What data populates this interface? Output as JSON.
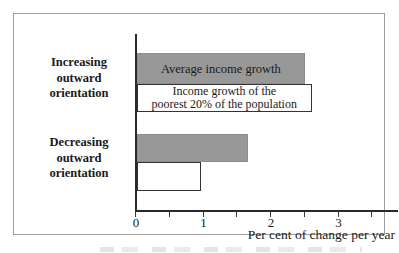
{
  "chart_data": {
    "type": "bar",
    "orientation": "horizontal",
    "title": "",
    "xlabel": "Per cent of change per year",
    "ylabel": "",
    "xlim": [
      0,
      3.85
    ],
    "xticks": [
      "0",
      "1",
      "2",
      "3"
    ],
    "minor_xticks": [
      0.5,
      1.5,
      2.5,
      3.5
    ],
    "grid": false,
    "legend_position": "labels-inside-first-group-bars",
    "categories": [
      "Increasing outward orientation",
      "Decreasing outward orientation"
    ],
    "series": [
      {
        "name": "Average income growth",
        "color": "#989898",
        "values": [
          2.5,
          1.65
        ]
      },
      {
        "name": "Income growth of the poorest 20% of the population",
        "color": "#ffffff",
        "values": [
          2.6,
          0.95
        ]
      }
    ]
  },
  "labels": {
    "category1_lines": [
      "Increasing",
      "outward",
      "orientation"
    ],
    "category2_lines": [
      "Decreasing",
      "outward",
      "orientation"
    ],
    "poorest_label_lines": [
      "Income growth of the",
      "poorest 20% of the population"
    ]
  },
  "colors": {
    "bar_gray": "#989898",
    "bar_white_border": "#333333",
    "axis": "#2a2a2a",
    "frame_border": "#9e9e9e"
  }
}
